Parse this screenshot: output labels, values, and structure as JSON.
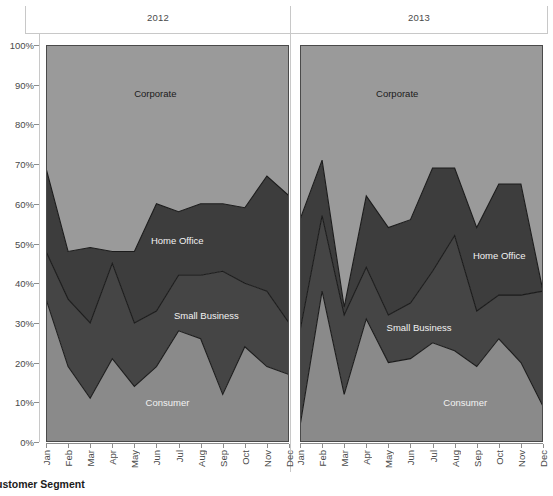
{
  "chart_data": {
    "type": "area",
    "title": "",
    "subtitle": "",
    "xlabel": "",
    "ylabel": "",
    "stacked": true,
    "normalized": true,
    "grid": false,
    "legend_position": "inline-labels",
    "ylim": [
      0,
      100
    ],
    "ytick_labels": [
      "0%",
      "10%",
      "20%",
      "30%",
      "40%",
      "50%",
      "60%",
      "70%",
      "80%",
      "90%",
      "100%"
    ],
    "ytick_values": [
      0,
      10,
      20,
      30,
      40,
      50,
      60,
      70,
      80,
      90,
      100
    ],
    "categories": [
      "Jan",
      "Feb",
      "Mar",
      "Apr",
      "May",
      "Jun",
      "Jul",
      "Aug",
      "Sep",
      "Oct",
      "Nov",
      "Dec"
    ],
    "panels": [
      {
        "label": "2012",
        "series": [
          {
            "name": "Consumer",
            "values": [
              36,
              19,
              11,
              21,
              14,
              19,
              28,
              26,
              12,
              24,
              19,
              17
            ]
          },
          {
            "name": "Small Business",
            "values": [
              12,
              17,
              19,
              24,
              16,
              14,
              14,
              16,
              31,
              16,
              19,
              13
            ]
          },
          {
            "name": "Home Office",
            "values": [
              21,
              12,
              19,
              3,
              18,
              27,
              16,
              18,
              17,
              19,
              29,
              32
            ]
          },
          {
            "name": "Corporate",
            "values": [
              31,
              52,
              51,
              52,
              52,
              40,
              42,
              40,
              40,
              41,
              33,
              38
            ]
          }
        ],
        "cumulative_consumer": [
          36,
          19,
          11,
          21,
          14,
          19,
          28,
          26,
          12,
          24,
          19,
          17
        ],
        "cumulative_small_business": [
          48,
          36,
          30,
          45,
          30,
          33,
          42,
          42,
          43,
          40,
          38,
          30
        ],
        "cumulative_home_office": [
          69,
          48,
          49,
          48,
          48,
          60,
          58,
          60,
          60,
          59,
          67,
          62
        ]
      },
      {
        "label": "2013",
        "series": [
          {
            "name": "Consumer",
            "values": [
              4,
              38,
              12,
              31,
              20,
              21,
              25,
              23,
              19,
              26,
              20,
              9
            ]
          },
          {
            "name": "Small Business",
            "values": [
              24,
              19,
              20,
              13,
              12,
              14,
              18,
              29,
              14,
              11,
              17,
              29
            ]
          },
          {
            "name": "Home Office",
            "values": [
              28,
              14,
              2,
              18,
              22,
              21,
              26,
              17,
              21,
              28,
              28,
              0
            ]
          },
          {
            "name": "Corporate",
            "values": [
              44,
              29,
              66,
              38,
              46,
              44,
              31,
              31,
              46,
              35,
              35,
              62
            ]
          }
        ],
        "cumulative_consumer": [
          4,
          38,
          12,
          31,
          20,
          21,
          25,
          23,
          19,
          26,
          20,
          9
        ],
        "cumulative_small_business": [
          28,
          57,
          32,
          44,
          32,
          35,
          43,
          52,
          33,
          37,
          37,
          38
        ],
        "cumulative_home_office": [
          56,
          71,
          34,
          62,
          54,
          56,
          69,
          69,
          54,
          65,
          65,
          38
        ]
      }
    ],
    "segment_colors": {
      "Corporate": "#9a9a9a",
      "Home Office": "#3d3d3d",
      "Small Business": "#454545",
      "Consumer": "#8a8a8a"
    },
    "area_labels": [
      {
        "text": "Corporate",
        "panel": 0,
        "x_pct": 45,
        "y_pct": 88,
        "tone": "dark"
      },
      {
        "text": "Home Office",
        "panel": 0,
        "x_pct": 54,
        "y_pct": 51,
        "tone": "light"
      },
      {
        "text": "Small Business",
        "panel": 0,
        "x_pct": 66,
        "y_pct": 32,
        "tone": "light"
      },
      {
        "text": "Consumer",
        "panel": 0,
        "x_pct": 50,
        "y_pct": 10,
        "tone": "light"
      },
      {
        "text": "Corporate",
        "panel": 1,
        "x_pct": 40,
        "y_pct": 88,
        "tone": "dark"
      },
      {
        "text": "Home Office",
        "panel": 1,
        "x_pct": 82,
        "y_pct": 47,
        "tone": "light"
      },
      {
        "text": "Small Business",
        "panel": 1,
        "x_pct": 49,
        "y_pct": 29,
        "tone": "light"
      },
      {
        "text": "Consumer",
        "panel": 1,
        "x_pct": 68,
        "y_pct": 10,
        "tone": "light"
      }
    ]
  },
  "caption": {
    "text": "ustomer Segment"
  },
  "colors": {
    "axis_line": "#8d8d8d",
    "grid_line": "#c8c8c8",
    "tick_text": "#4a4a4a",
    "series_stroke": "#1b1b1b"
  }
}
